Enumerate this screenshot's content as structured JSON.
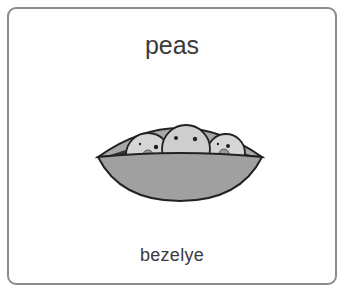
{
  "card": {
    "title": "peas",
    "subtitle": "bezelye",
    "image": {
      "icon": "pea-pod-icon",
      "description": "pea pod with three smiling peas"
    }
  },
  "colors": {
    "border": "#8c8c8c",
    "text": "#3a3a3a",
    "pod": "#9a9a9a",
    "pea": "#d4d4d4"
  }
}
